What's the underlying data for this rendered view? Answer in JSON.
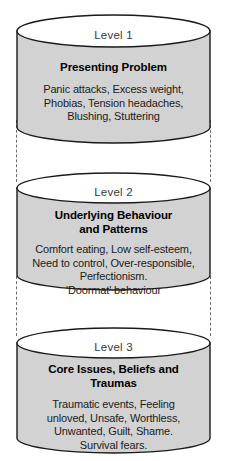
{
  "diagram": {
    "type": "three-tier-cylinder-stack",
    "style": {
      "cylinder_fill": "#d2d2d2",
      "cylinder_top_fill": "#ffffff",
      "outline_color": "#1a1a1a",
      "connector_color": "#6f6f6f",
      "background": "#ffffff"
    },
    "levels": [
      {
        "label": "Level 1",
        "title": "Presenting Problem",
        "body_lines": [
          "Panic attacks, Excess weight,",
          "Phobias, Tension headaches,",
          "Blushing, Stuttering"
        ]
      },
      {
        "label": "Level 2",
        "title_lines": [
          "Underlying Behaviour",
          "and Patterns"
        ],
        "body_lines": [
          "Comfort eating, Low self-esteem,",
          "Need to control, Over-responsible,",
          "Perfectionism.",
          "'Doormat' behaviour"
        ]
      },
      {
        "label": "Level 3",
        "title_lines": [
          "Core Issues, Beliefs and",
          "Traumas"
        ],
        "body_lines": [
          "Traumatic events, Feeling",
          "unloved, Unsafe, Worthless,",
          "Unwanted, Guilt, Shame.",
          "Survival fears."
        ]
      }
    ],
    "connectors": [
      {
        "name": "connector-level-1-to-2"
      },
      {
        "name": "connector-level-2-to-3"
      }
    ]
  }
}
